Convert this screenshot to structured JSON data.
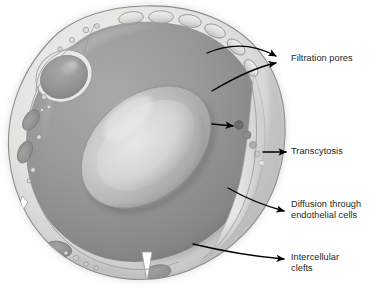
{
  "figure": {
    "width": 381,
    "height": 293,
    "background_color": "#ffffff"
  },
  "colors": {
    "background": "#ffffff",
    "outline": "#6f6f6f",
    "rim_light": "#e8e8e6",
    "rim_mid": "#c9c9c6",
    "rim_shadow": "#9a9a97",
    "lumen_dark": "#8e8e8b",
    "lumen_mid": "#a6a6a3",
    "rbc_light": "#cfcfcc",
    "rbc_mid": "#b3b3b0",
    "nucleus_dark": "#8a8a87",
    "mitochondria": "#939390",
    "vesicle_dark": "#6d6d6a",
    "vesicle_light": "#d8d8d5",
    "arrow": "#000000",
    "text": "#231f20"
  },
  "labels": [
    {
      "id": "filtration-pores",
      "text": "Filtration pores",
      "lines": [
        "Filtration pores"
      ],
      "x": 291,
      "y": 58,
      "arrow_count": 2,
      "points_to": "fenestrations along upper endothelial wall"
    },
    {
      "id": "transcytosis",
      "text": "Transcytosis",
      "lines": [
        "Transcytosis"
      ],
      "x": 291,
      "y": 147,
      "arrow_count": 1,
      "points_to": "vesicle chain crossing endothelial cell"
    },
    {
      "id": "diffusion-through-endothelial-cells",
      "text": "Diffusion through endothelial cells",
      "lines": [
        "Diffusion through",
        "endothelial cells"
      ],
      "x": 291,
      "y": 204,
      "arrow_count": 1,
      "points_to": "endothelial cell body on right wall"
    },
    {
      "id": "intercellular-clefts",
      "text": "Intercellular clefts",
      "lines": [
        "Intercellular",
        "clefts"
      ],
      "x": 291,
      "y": 253,
      "arrow_count": 1,
      "points_to": "gap between adjacent endothelial cells"
    }
  ],
  "structures": {
    "capillary_wall": "endothelial rim",
    "lumen": "capillary lumen",
    "red_blood_cell": "erythrocyte in lumen",
    "nucleus_upper_left": "endothelial cell nucleus",
    "nucleus_lower_left": "endothelial cell nucleus",
    "nucleus_lower_right": "endothelial cell nucleus",
    "mitochondria_count": 2,
    "fenestration_count": 6,
    "vesicle_chain_count": 5,
    "cleft_count": 3
  }
}
